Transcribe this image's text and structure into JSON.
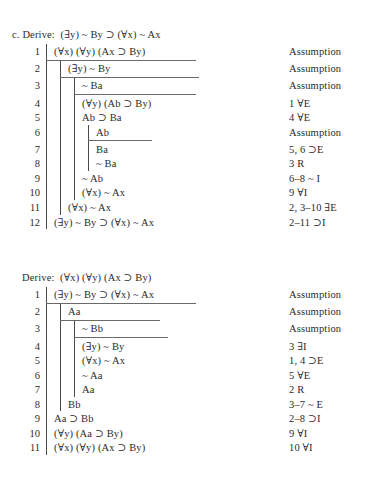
{
  "document": {
    "type": "logic-derivation-exercises",
    "background_color": "#ffffff",
    "text_color": "#2b2b2b",
    "rule_line_color": "#4a4a4a"
  },
  "proofs": [
    {
      "label": "c.",
      "derive_word": "Derive:",
      "goal": "(∃y) ~ By ⊃ (∀x) ~ Ax",
      "heading_full": "c. Derive: (∃y) ~ By ⊃ (∀x) ~ Ax",
      "rows": [
        {
          "n": "1",
          "depth": 1,
          "formula": "(∀x) (∀y) (Ax ⊃ By)",
          "rule": "Assumption",
          "bar_below": true
        },
        {
          "n": "2",
          "depth": 2,
          "formula": "(∃y) ~ By",
          "rule": "Assumption",
          "bar_below": true
        },
        {
          "n": "3",
          "depth": 3,
          "formula": "~ Ba",
          "rule": "Assumption",
          "bar_below": true
        },
        {
          "n": "4",
          "depth": 3,
          "formula": "(∀y) (Ab ⊃ By)",
          "rule": "1 ∀E",
          "bar_below": false
        },
        {
          "n": "5",
          "depth": 3,
          "formula": "Ab ⊃ Ba",
          "rule": "4 ∀E",
          "bar_below": false
        },
        {
          "n": "6",
          "depth": 4,
          "formula": "Ab",
          "rule": "Assumption",
          "bar_below": true
        },
        {
          "n": "7",
          "depth": 4,
          "formula": "Ba",
          "rule": "5, 6 ⊃E",
          "bar_below": false
        },
        {
          "n": "8",
          "depth": 4,
          "formula": "~ Ba",
          "rule": "3 R",
          "bar_below": false
        },
        {
          "n": "9",
          "depth": 3,
          "formula": "~ Ab",
          "rule": "6–8 ~ I",
          "bar_below": false
        },
        {
          "n": "10",
          "depth": 3,
          "formula": "(∀x) ~ Ax",
          "rule": "9 ∀I",
          "bar_below": false
        },
        {
          "n": "11",
          "depth": 2,
          "formula": "(∀x) ~ Ax",
          "rule": "2, 3–10 ∃E",
          "bar_below": false
        },
        {
          "n": "12",
          "depth": 1,
          "formula": "(∃y) ~ By ⊃ (∀x) ~ Ax",
          "rule": "2–11 ⊃I",
          "bar_below": false
        }
      ]
    },
    {
      "label": "",
      "derive_word": "Derive:",
      "goal": "(∀x) (∀y) (Ax ⊃ By)",
      "heading_full": "Derive: (∀x) (∀y) (Ax ⊃ By)",
      "rows": [
        {
          "n": "1",
          "depth": 1,
          "formula": "(∃y) ~ By ⊃ (∀x) ~ Ax",
          "rule": "Assumption",
          "bar_below": true
        },
        {
          "n": "2",
          "depth": 2,
          "formula": "Aa",
          "rule": "Assumption",
          "bar_below": true
        },
        {
          "n": "3",
          "depth": 3,
          "formula": "~ Bb",
          "rule": "Assumption",
          "bar_below": true
        },
        {
          "n": "4",
          "depth": 3,
          "formula": "(∃y) ~ By",
          "rule": "3 ∃I",
          "bar_below": false
        },
        {
          "n": "5",
          "depth": 3,
          "formula": "(∀x) ~ Ax",
          "rule": "1, 4 ⊃E",
          "bar_below": false
        },
        {
          "n": "6",
          "depth": 3,
          "formula": "~ Aa",
          "rule": "5 ∀E",
          "bar_below": false
        },
        {
          "n": "7",
          "depth": 3,
          "formula": "Aa",
          "rule": "2 R",
          "bar_below": false
        },
        {
          "n": "8",
          "depth": 2,
          "formula": "Bb",
          "rule": "3–7 ~ E",
          "bar_below": false
        },
        {
          "n": "9",
          "depth": 1,
          "formula": "Aa ⊃ Bb",
          "rule": "2–8 ⊃I",
          "bar_below": false
        },
        {
          "n": "10",
          "depth": 1,
          "formula": "(∀y) (Aa ⊃ By)",
          "rule": "9 ∀I",
          "bar_below": false
        },
        {
          "n": "11",
          "depth": 1,
          "formula": "(∀x) (∀y) (Ax ⊃ By)",
          "rule": "10 ∀I",
          "bar_below": false
        }
      ]
    }
  ]
}
